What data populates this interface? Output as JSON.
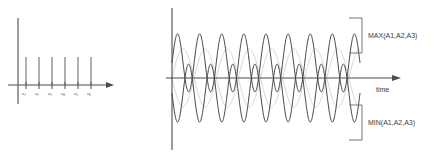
{
  "figure": {
    "background_color": "#ffffff",
    "wave_dark_color": "#3a3a3a",
    "wave_light_color": "#cfcfcf",
    "axis_color": "#4d4d4d"
  },
  "chart_data": [
    {
      "id": "left-spectrum",
      "type": "bar",
      "title": "",
      "xlabel": "",
      "ylabel": "",
      "grid": false,
      "legend": null,
      "categories": [
        "a1",
        "a2",
        "a3",
        "a4",
        "a5",
        "a6"
      ],
      "tick_labels": [
        "a",
        "a",
        "a",
        "a",
        "a",
        "a"
      ],
      "tick_subscripts": [
        "1",
        "2",
        "3",
        "4",
        "5",
        "6"
      ],
      "values": [
        1.0,
        1.0,
        1.0,
        1.0,
        1.0,
        1.0
      ],
      "x": [
        1,
        2,
        3,
        4,
        5,
        6
      ],
      "xlim": [
        0,
        7.6
      ],
      "ylim": [
        0,
        1.35
      ],
      "has_x_arrow": true,
      "has_y_axis": true
    },
    {
      "id": "right-waveform",
      "type": "line",
      "title": "",
      "xlabel": "time",
      "ylabel": "",
      "grid": false,
      "legend": null,
      "xlim": [
        0,
        9.2
      ],
      "ylim": [
        -1.12,
        1.12
      ],
      "cycles": 8.5,
      "series": [
        {
          "name": "upper-envelope-wave",
          "color": "#3a3a3a",
          "amplitude": 1.0,
          "offset": 0.52,
          "cycles": 8.5,
          "phase": 0.0
        },
        {
          "name": "lower-envelope-wave",
          "color": "#3a3a3a",
          "amplitude": 1.0,
          "offset": -0.52,
          "cycles": 8.5,
          "phase": 3.14159
        },
        {
          "name": "crossing-wave-a",
          "color": "#cfcfcf",
          "amplitude": 1.0,
          "offset": 0.0,
          "cycles": 4.25,
          "phase": 0.0
        },
        {
          "name": "crossing-wave-b",
          "color": "#cfcfcf",
          "amplitude": 1.0,
          "offset": 0.0,
          "cycles": 4.25,
          "phase": 3.14159
        }
      ],
      "annotations": [
        {
          "name": "max-bracket-label",
          "text": "MAX(A1,A2,A3)",
          "position": "upper-right"
        },
        {
          "name": "min-bracket-label",
          "text": "MIN(A1,A2,A3)",
          "position": "lower-right"
        },
        {
          "name": "time-axis-label",
          "text": "time",
          "position": "right-of-axis"
        }
      ]
    }
  ],
  "labels": {
    "max_bracket": "MAX(A1,A2,A3)",
    "min_bracket": "MIN(A1,A2,A3)",
    "time_axis": "time"
  }
}
